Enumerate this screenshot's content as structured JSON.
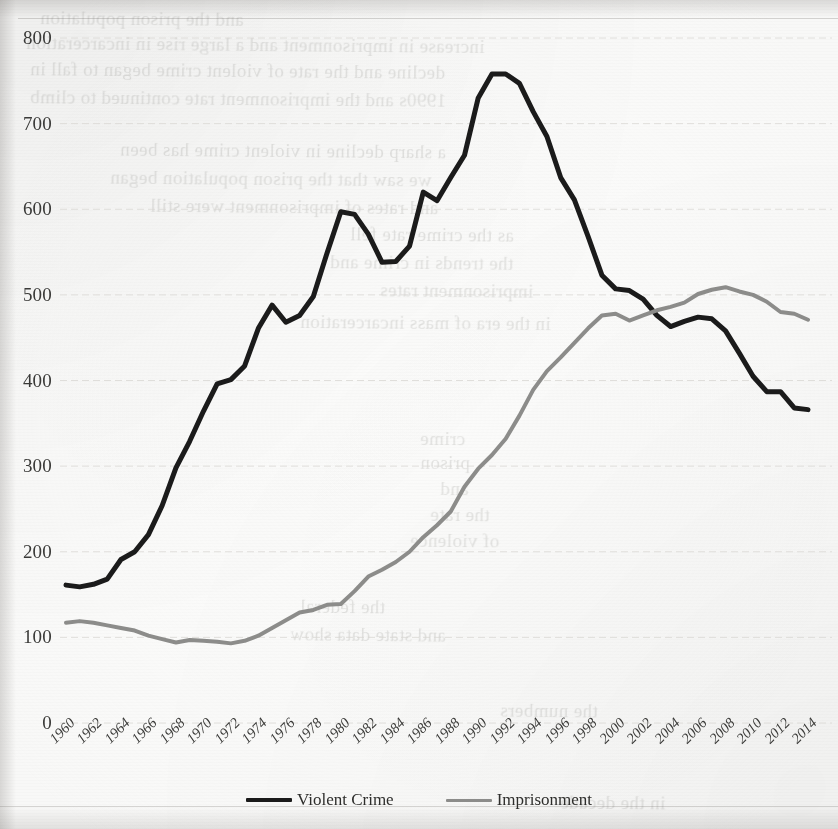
{
  "page": {
    "background_color": "#fdfdfc",
    "bleed_through_lines": [
      {
        "text": "and the prison population",
        "x": 40,
        "y": 8
      },
      {
        "text": "increase in imprisonment and a large rise in incarceration",
        "x": 26,
        "y": 34
      },
      {
        "text": "decline and the rate of violent crime began to fall in",
        "x": 30,
        "y": 60
      },
      {
        "text": "1990s and the imprisonment rate continued to climb",
        "x": 30,
        "y": 88
      },
      {
        "text": "a sharp decline in violent crime has been",
        "x": 120,
        "y": 140
      },
      {
        "text": "we saw that the prison population began",
        "x": 110,
        "y": 168
      },
      {
        "text": "and rates of imprisonment were still",
        "x": 150,
        "y": 196
      },
      {
        "text": "as the crime rate fell",
        "x": 350,
        "y": 224
      },
      {
        "text": "the trends in crime and",
        "x": 330,
        "y": 252
      },
      {
        "text": "imprisonment rates",
        "x": 380,
        "y": 280
      },
      {
        "text": "in the era of mass incarceration",
        "x": 300,
        "y": 312
      },
      {
        "text": "crime",
        "x": 420,
        "y": 428
      },
      {
        "text": "prison",
        "x": 420,
        "y": 452
      },
      {
        "text": "and",
        "x": 440,
        "y": 478
      },
      {
        "text": "the rate",
        "x": 430,
        "y": 504
      },
      {
        "text": "of violence",
        "x": 410,
        "y": 530
      },
      {
        "text": "the federal",
        "x": 300,
        "y": 596
      },
      {
        "text": "and state data show",
        "x": 290,
        "y": 624
      },
      {
        "text": "the numbers",
        "x": 500,
        "y": 700
      },
      {
        "text": "in the decade",
        "x": 560,
        "y": 792
      }
    ],
    "horizontal_rules": [
      {
        "x": 18,
        "y": 18,
        "width": 820
      },
      {
        "x": 0,
        "y": 806,
        "width": 838
      }
    ]
  },
  "chart_data": {
    "type": "line",
    "title": "",
    "subtitle": "",
    "xlabel": "",
    "ylabel": "",
    "xlim": [
      1960,
      2014
    ],
    "ylim": [
      0,
      800
    ],
    "y_ticks": [
      0,
      100,
      200,
      300,
      400,
      500,
      600,
      700,
      800
    ],
    "grid": true,
    "grid_axis": "y",
    "legend_position": "bottom-center",
    "x_tick_labels": [
      "1960",
      "1962",
      "1964",
      "1966",
      "1968",
      "1970",
      "1972",
      "1974",
      "1976",
      "1978",
      "1980",
      "1982",
      "1984",
      "1986",
      "1988",
      "1990",
      "1992",
      "1994",
      "1996",
      "1998",
      "2000",
      "2002",
      "2004",
      "2006",
      "2008",
      "2010",
      "2012",
      "2014"
    ],
    "x": [
      1960,
      1961,
      1962,
      1963,
      1964,
      1965,
      1966,
      1967,
      1968,
      1969,
      1970,
      1971,
      1972,
      1973,
      1974,
      1975,
      1976,
      1977,
      1978,
      1979,
      1980,
      1981,
      1982,
      1983,
      1984,
      1985,
      1986,
      1987,
      1988,
      1989,
      1990,
      1991,
      1992,
      1993,
      1994,
      1995,
      1996,
      1997,
      1998,
      1999,
      2000,
      2001,
      2002,
      2003,
      2004,
      2005,
      2006,
      2007,
      2008,
      2009,
      2010,
      2011,
      2012,
      2013,
      2014
    ],
    "series": [
      {
        "name": "Violent Crime",
        "color": "#1b1b1b",
        "line_width": 5,
        "values": [
          161,
          159,
          162,
          168,
          191,
          200,
          220,
          254,
          298,
          329,
          364,
          396,
          401,
          417,
          461,
          488,
          468,
          476,
          498,
          549,
          597,
          594,
          571,
          538,
          539,
          557,
          620,
          610,
          637,
          663,
          730,
          758,
          758,
          747,
          714,
          685,
          637,
          611,
          568,
          523,
          507,
          505,
          495,
          476,
          463,
          469,
          474,
          472,
          458,
          432,
          405,
          387,
          387,
          368,
          366
        ]
      },
      {
        "name": "Imprisonment",
        "color": "#8c8c8a",
        "line_width": 4,
        "values": [
          117,
          119,
          117,
          114,
          111,
          108,
          102,
          98,
          94,
          97,
          96,
          95,
          93,
          96,
          102,
          111,
          120,
          129,
          132,
          138,
          139,
          154,
          171,
          179,
          188,
          200,
          217,
          231,
          247,
          276,
          297,
          313,
          332,
          359,
          389,
          411,
          427,
          444,
          461,
          476,
          478,
          470,
          476,
          482,
          486,
          491,
          501,
          506,
          509,
          504,
          500,
          492,
          480,
          478,
          471
        ]
      }
    ],
    "legend": [
      {
        "label": "Violent Crime",
        "color": "#1b1b1b"
      },
      {
        "label": "Imprisonment",
        "color": "#8c8c8a"
      }
    ]
  }
}
